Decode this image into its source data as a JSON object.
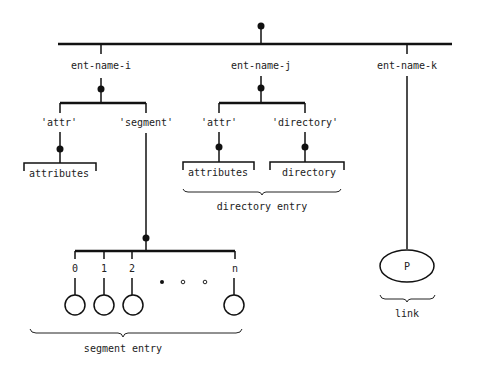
{
  "diagram": {
    "background": "#ffffff",
    "ink": "#111111",
    "entries": [
      {
        "name": "ent-name-i"
      },
      {
        "name": "ent-name-j"
      },
      {
        "name": "ent-name-k"
      }
    ],
    "ent_i": {
      "children": [
        "'attr'",
        "'segment'"
      ],
      "attr_leaf": "attributes"
    },
    "ent_j": {
      "children": [
        "'attr'",
        "'directory'"
      ],
      "attr_leaf": "attributes",
      "directory_leaf": "directory",
      "group_label": "directory entry"
    },
    "segment": {
      "indices": [
        "0",
        "1",
        "2",
        "n"
      ],
      "ellipsis": "• ∘ ∘",
      "group_label": "segment entry"
    },
    "ent_k": {
      "node_label": "P",
      "group_label": "link"
    }
  }
}
